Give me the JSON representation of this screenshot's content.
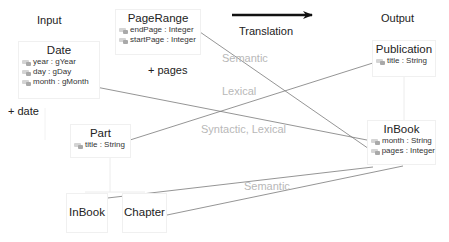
{
  "headers": {
    "input": "Input",
    "output": "Output",
    "translation": "Translation"
  },
  "annotations": {
    "plus_pages": "+ pages",
    "plus_date": "+ date"
  },
  "input_classes": {
    "pagerange": {
      "name": "PageRange",
      "attributes": [
        "endPage : Integer",
        "startPage : Integer"
      ]
    },
    "date": {
      "name": "Date",
      "attributes": [
        "year : gYear",
        "day : gDay",
        "month : gMonth"
      ]
    },
    "part": {
      "name": "Part",
      "attributes": [
        "title : String"
      ]
    },
    "inbook": {
      "name": "InBook"
    },
    "chapter": {
      "name": "Chapter"
    }
  },
  "output_classes": {
    "publication": {
      "name": "Publication",
      "attributes": [
        "title : String"
      ]
    },
    "inbook": {
      "name": "InBook",
      "attributes": [
        "month : String",
        "pages : Integer"
      ]
    }
  },
  "mapping_labels": {
    "semantic_top": "Semantic",
    "lexical": "Lexical",
    "syntactic_lexical": "Syntactic, Lexical",
    "semantic_bottom": "Semantic"
  },
  "colors": {
    "line": "#7a7a7a",
    "muted_label": "#b8b8b8",
    "arrow": "#111111",
    "box_border": "#f0f0f0"
  }
}
